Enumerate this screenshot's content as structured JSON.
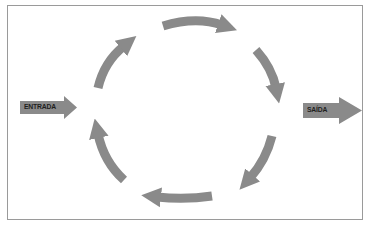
{
  "diagram": {
    "type": "cycle",
    "input_label": "ENTRADA",
    "output_label": "SAÍDA",
    "cycle_arrow_count": 6,
    "cycle_direction": "clockwise",
    "colors": {
      "arrow": "#8a8a8a",
      "frame_border": "#9a9a9a",
      "label_text": "#1e1e1e",
      "background": "#ffffff"
    }
  }
}
